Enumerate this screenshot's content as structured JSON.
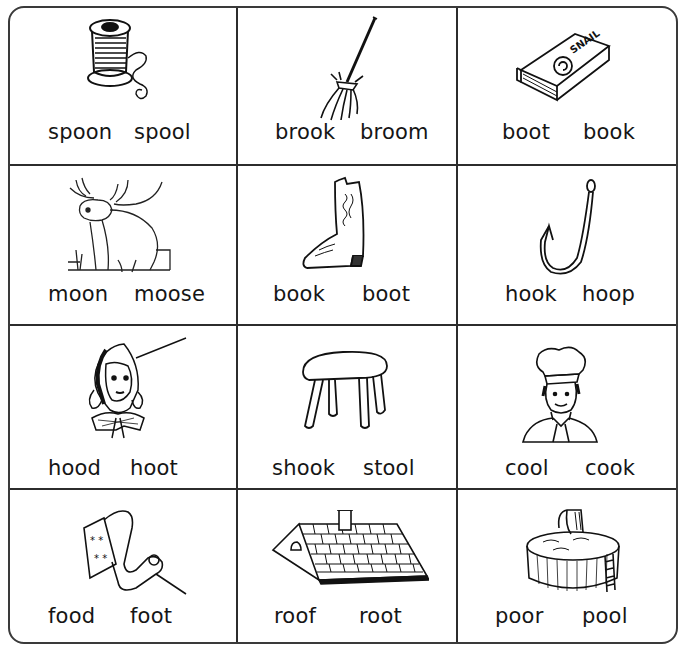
{
  "worksheet": {
    "instructions_visible": false,
    "rows": [
      [
        {
          "picture": "spool-of-thread-icon",
          "words": [
            "spoon",
            "spool"
          ]
        },
        {
          "picture": "broom-icon",
          "words": [
            "brook",
            "broom"
          ]
        },
        {
          "picture": "book-icon",
          "book_cover_text": "SNAIL",
          "words": [
            "boot",
            "book"
          ]
        }
      ],
      [
        {
          "picture": "moose-icon",
          "words": [
            "moon",
            "moose"
          ]
        },
        {
          "picture": "cowboy-boot-icon",
          "words": [
            "book",
            "boot"
          ]
        },
        {
          "picture": "fish-hook-icon",
          "words": [
            "hook",
            "hoop"
          ]
        }
      ],
      [
        {
          "picture": "girl-in-hood-icon",
          "words": [
            "hood",
            "hoot"
          ]
        },
        {
          "picture": "stool-icon",
          "words": [
            "shook",
            "stool"
          ]
        },
        {
          "picture": "chef-cook-icon",
          "words": [
            "cool",
            "cook"
          ]
        }
      ],
      [
        {
          "picture": "foot-icon",
          "words": [
            "food",
            "foot"
          ]
        },
        {
          "picture": "roof-icon",
          "words": [
            "roof",
            "root"
          ]
        },
        {
          "picture": "swimming-pool-icon",
          "words": [
            "poor",
            "pool"
          ]
        }
      ]
    ]
  }
}
